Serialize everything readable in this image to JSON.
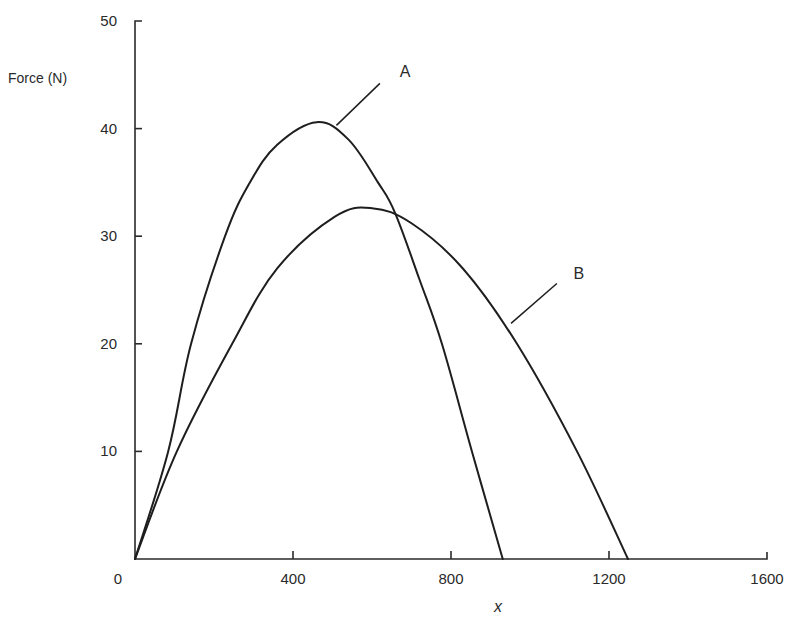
{
  "chart_data": {
    "type": "line",
    "title": "",
    "xlabel": "x",
    "ylabel": "Force (N)",
    "xlim": [
      0,
      1600
    ],
    "ylim": [
      0,
      50
    ],
    "grid": false,
    "legend": "none (inline labels A and B with leader lines)",
    "x_ticks": [
      0,
      400,
      800,
      1200,
      1600
    ],
    "x_tick_labels": [
      "0",
      "400",
      "800",
      "1200",
      "1600"
    ],
    "y_ticks": [
      10,
      20,
      30,
      40,
      50
    ],
    "y_tick_labels": [
      "10",
      "20",
      "30",
      "40",
      "50"
    ],
    "series": [
      {
        "name": "A",
        "color": "#1e1e1e",
        "points": [
          [
            0,
            0
          ],
          [
            84,
            10
          ],
          [
            142,
            20
          ],
          [
            228,
            30
          ],
          [
            291,
            35
          ],
          [
            360,
            38.5
          ],
          [
            460,
            40.6
          ],
          [
            540,
            39
          ],
          [
            615,
            35
          ],
          [
            658,
            32.2
          ],
          [
            720,
            26
          ],
          [
            777,
            20
          ],
          [
            853,
            10
          ],
          [
            931,
            0
          ]
        ]
      },
      {
        "name": "B",
        "color": "#1e1e1e",
        "points": [
          [
            0,
            0
          ],
          [
            106,
            10
          ],
          [
            246,
            20
          ],
          [
            360,
            27
          ],
          [
            505,
            31.8
          ],
          [
            600,
            32.6
          ],
          [
            700,
            31.2
          ],
          [
            830,
            27
          ],
          [
            967,
            20
          ],
          [
            1119,
            10
          ],
          [
            1248,
            0
          ]
        ]
      }
    ],
    "annotations": [
      {
        "text": "A",
        "label_at": [
          670,
          44.8
        ],
        "line_from": [
          510,
          40.3
        ],
        "line_to": [
          620,
          44.2
        ]
      },
      {
        "text": "B",
        "label_at": [
          1110,
          26.0
        ],
        "line_from": [
          952,
          21.9
        ],
        "line_to": [
          1068,
          25.6
        ]
      }
    ]
  },
  "labels": {
    "y_axis_title": "Force (N)",
    "x_axis_title": "x",
    "origin": "0",
    "series_a": "A",
    "series_b": "B"
  }
}
